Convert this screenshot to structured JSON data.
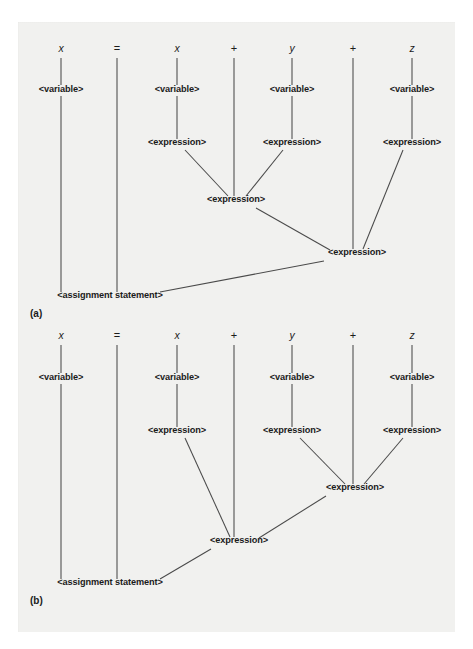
{
  "figure": {
    "kind": "parse-tree-figure",
    "panels": [
      "(a)",
      "(b)"
    ],
    "sentence_tokens": [
      "x",
      "=",
      "x",
      "+",
      "y",
      "+",
      "z"
    ],
    "label_variable": "<variable>",
    "label_expression": "<expression>",
    "label_assignment": "<assignment statement>",
    "colors": {
      "page": "#ffffff",
      "paper": "#f1f1ef",
      "ink": "#1b1b1b",
      "edge": "#4a4a4a"
    }
  },
  "panel_a": {
    "caption": "(a)",
    "caption_pos": {
      "x": 30,
      "y": 317
    },
    "terminals": [
      {
        "token": "x",
        "x": 61,
        "y": 52,
        "kind": "ident"
      },
      {
        "token": "=",
        "x": 117,
        "y": 52,
        "kind": "op"
      },
      {
        "token": "x",
        "x": 177,
        "y": 52,
        "kind": "ident"
      },
      {
        "token": "+",
        "x": 234,
        "y": 52,
        "kind": "op"
      },
      {
        "token": "y",
        "x": 292,
        "y": 52,
        "kind": "ident"
      },
      {
        "token": "+",
        "x": 353,
        "y": 52,
        "kind": "op"
      },
      {
        "token": "z",
        "x": 412,
        "y": 52,
        "kind": "ident"
      }
    ],
    "nodes": [
      {
        "id": "a-var-x1",
        "label": "<variable>",
        "x": 61,
        "y": 92
      },
      {
        "id": "a-var-x2",
        "label": "<variable>",
        "x": 177,
        "y": 92
      },
      {
        "id": "a-var-y",
        "label": "<variable>",
        "x": 292,
        "y": 92
      },
      {
        "id": "a-var-z",
        "label": "<variable>",
        "x": 412,
        "y": 92
      },
      {
        "id": "a-expr-x2",
        "label": "<expression>",
        "x": 177,
        "y": 145
      },
      {
        "id": "a-expr-y",
        "label": "<expression>",
        "x": 292,
        "y": 145
      },
      {
        "id": "a-expr-z",
        "label": "<expression>",
        "x": 412,
        "y": 145
      },
      {
        "id": "a-expr-xy",
        "label": "<expression>",
        "x": 236,
        "y": 202
      },
      {
        "id": "a-expr-top",
        "label": "<expression>",
        "x": 357,
        "y": 255
      },
      {
        "id": "a-assign",
        "label": "<assignment statement>",
        "x": 110,
        "y": 298
      }
    ],
    "edges": [
      {
        "from": "terminal-x1",
        "x1": 61,
        "y1": 58,
        "x2": 61,
        "y2": 85
      },
      {
        "from": "terminal-x2",
        "x1": 177,
        "y1": 58,
        "x2": 177,
        "y2": 85
      },
      {
        "from": "terminal-y",
        "x1": 292,
        "y1": 58,
        "x2": 292,
        "y2": 85
      },
      {
        "from": "terminal-z",
        "x1": 412,
        "y1": 58,
        "x2": 412,
        "y2": 85
      },
      {
        "from": "terminal-eq",
        "x1": 117,
        "y1": 58,
        "x2": 117,
        "y2": 292
      },
      {
        "from": "terminal-plus1",
        "x1": 234,
        "y1": 58,
        "x2": 234,
        "y2": 196
      },
      {
        "from": "terminal-plus2",
        "x1": 353,
        "y1": 58,
        "x2": 353,
        "y2": 249
      },
      {
        "from": "var-x1-to-assign",
        "x1": 61,
        "y1": 96,
        "x2": 61,
        "y2": 292
      },
      {
        "from": "var-x2-to-expr",
        "x1": 177,
        "y1": 96,
        "x2": 177,
        "y2": 139
      },
      {
        "from": "var-y-to-expr",
        "x1": 292,
        "y1": 96,
        "x2": 292,
        "y2": 139
      },
      {
        "from": "var-z-to-expr",
        "x1": 412,
        "y1": 96,
        "x2": 412,
        "y2": 139
      },
      {
        "from": "expr-x2-to-xy",
        "x1": 185,
        "y1": 150,
        "x2": 228,
        "y2": 196
      },
      {
        "from": "expr-y-to-xy",
        "x1": 283,
        "y1": 150,
        "x2": 246,
        "y2": 196
      },
      {
        "from": "expr-z-to-top",
        "x1": 403,
        "y1": 150,
        "x2": 363,
        "y2": 249
      },
      {
        "from": "expr-xy-to-top",
        "x1": 256,
        "y1": 208,
        "x2": 330,
        "y2": 250
      },
      {
        "from": "expr-top-to-assign",
        "x1": 324,
        "y1": 261,
        "x2": 160,
        "y2": 292
      }
    ]
  },
  "panel_b": {
    "caption": "(b)",
    "caption_pos": {
      "x": 30,
      "y": 604
    },
    "terminals": [
      {
        "token": "x",
        "x": 61,
        "y": 339,
        "kind": "ident"
      },
      {
        "token": "=",
        "x": 117,
        "y": 339,
        "kind": "op"
      },
      {
        "token": "x",
        "x": 177,
        "y": 339,
        "kind": "ident"
      },
      {
        "token": "+",
        "x": 234,
        "y": 339,
        "kind": "op"
      },
      {
        "token": "y",
        "x": 292,
        "y": 339,
        "kind": "ident"
      },
      {
        "token": "+",
        "x": 353,
        "y": 339,
        "kind": "op"
      },
      {
        "token": "z",
        "x": 412,
        "y": 339,
        "kind": "ident"
      }
    ],
    "nodes": [
      {
        "id": "b-var-x1",
        "label": "<variable>",
        "x": 61,
        "y": 380
      },
      {
        "id": "b-var-x2",
        "label": "<variable>",
        "x": 177,
        "y": 380
      },
      {
        "id": "b-var-y",
        "label": "<variable>",
        "x": 292,
        "y": 380
      },
      {
        "id": "b-var-z",
        "label": "<variable>",
        "x": 412,
        "y": 380
      },
      {
        "id": "b-expr-x2",
        "label": "<expression>",
        "x": 177,
        "y": 433
      },
      {
        "id": "b-expr-y",
        "label": "<expression>",
        "x": 292,
        "y": 433
      },
      {
        "id": "b-expr-z",
        "label": "<expression>",
        "x": 412,
        "y": 433
      },
      {
        "id": "b-expr-yz",
        "label": "<expression>",
        "x": 355,
        "y": 490
      },
      {
        "id": "b-expr-top",
        "label": "<expression>",
        "x": 239,
        "y": 543
      },
      {
        "id": "b-assign",
        "label": "<assignment statement>",
        "x": 110,
        "y": 585
      }
    ],
    "edges": [
      {
        "from": "terminal-x1",
        "x1": 61,
        "y1": 345,
        "x2": 61,
        "y2": 373
      },
      {
        "from": "terminal-x2",
        "x1": 177,
        "y1": 345,
        "x2": 177,
        "y2": 373
      },
      {
        "from": "terminal-y",
        "x1": 292,
        "y1": 345,
        "x2": 292,
        "y2": 373
      },
      {
        "from": "terminal-z",
        "x1": 412,
        "y1": 345,
        "x2": 412,
        "y2": 373
      },
      {
        "from": "terminal-eq",
        "x1": 117,
        "y1": 345,
        "x2": 117,
        "y2": 579
      },
      {
        "from": "terminal-plus1",
        "x1": 234,
        "y1": 345,
        "x2": 234,
        "y2": 537
      },
      {
        "from": "terminal-plus2",
        "x1": 353,
        "y1": 345,
        "x2": 353,
        "y2": 484
      },
      {
        "from": "var-x1-to-assign",
        "x1": 61,
        "y1": 384,
        "x2": 61,
        "y2": 579
      },
      {
        "from": "var-x2-to-expr",
        "x1": 177,
        "y1": 384,
        "x2": 177,
        "y2": 427
      },
      {
        "from": "var-y-to-expr",
        "x1": 292,
        "y1": 384,
        "x2": 292,
        "y2": 427
      },
      {
        "from": "var-z-to-expr",
        "x1": 412,
        "y1": 384,
        "x2": 412,
        "y2": 427
      },
      {
        "from": "expr-y-to-yz",
        "x1": 300,
        "y1": 438,
        "x2": 345,
        "y2": 484
      },
      {
        "from": "expr-z-to-yz",
        "x1": 403,
        "y1": 438,
        "x2": 364,
        "y2": 484
      },
      {
        "from": "expr-x2-to-top",
        "x1": 185,
        "y1": 438,
        "x2": 230,
        "y2": 537
      },
      {
        "from": "expr-yz-to-top",
        "x1": 326,
        "y1": 496,
        "x2": 259,
        "y2": 538
      },
      {
        "from": "expr-top-to-assign",
        "x1": 211,
        "y1": 549,
        "x2": 160,
        "y2": 579
      }
    ]
  }
}
